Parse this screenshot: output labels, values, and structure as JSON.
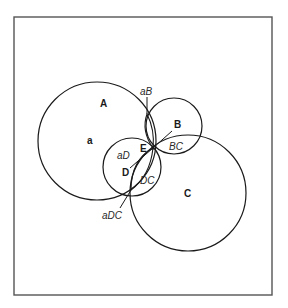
{
  "diagram": {
    "frame": {
      "x": 14,
      "y": 17,
      "width": 258,
      "height": 278,
      "stroke": "#555555"
    },
    "circles": [
      {
        "id": "A",
        "cx": 97,
        "cy": 141,
        "r": 59
      },
      {
        "id": "B",
        "cx": 174,
        "cy": 126,
        "r": 28
      },
      {
        "id": "C",
        "cx": 188,
        "cy": 193,
        "r": 58
      },
      {
        "id": "D",
        "cx": 132,
        "cy": 167,
        "r": 29
      }
    ],
    "labels": {
      "A": "A",
      "a": "a",
      "B": "B",
      "C": "C",
      "D": "D",
      "E": "E",
      "aB": "aB",
      "aD": "aD",
      "BC": "BC",
      "DC": "DC",
      "aDC": "aDC"
    },
    "stroke_color": "#1a1a1a"
  }
}
